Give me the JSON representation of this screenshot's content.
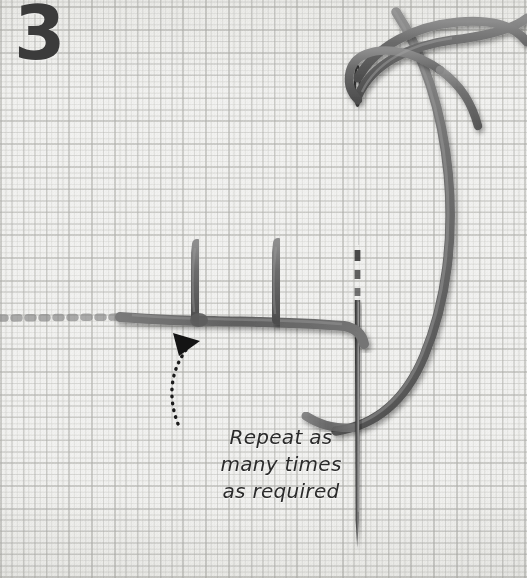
{
  "image": {
    "subject": "embroidery-blanket-stitch-step-photo",
    "width": 527,
    "height": 578,
    "background_color": "#f2f2f0"
  },
  "step": {
    "number": "3",
    "color": "#3b3b3b"
  },
  "annotation": {
    "lines": [
      "Repeat as",
      "many times",
      "as required"
    ],
    "full_text": "Repeat as many times as required",
    "color": "#2b2b2b",
    "arrow": {
      "style": "dotted-curved",
      "head": "solid-triangle",
      "points_to": "stitch-junction",
      "color": "#1b1b1b"
    }
  },
  "materials": {
    "fabric": {
      "name": "aida-cloth",
      "weave": "even-weave-grid",
      "color": "#f2f2f0"
    },
    "thread": {
      "color": "#6f6f6f",
      "shadow_color": "#4a4a4a",
      "highlight_color": "#9a9a9a"
    },
    "needle": {
      "color": "#4b4b4b",
      "highlight_color": "#8f8f8f",
      "orientation": "vertical",
      "eye_position": "top",
      "tip_position": "bottom"
    }
  },
  "stitch": {
    "type": "blanket-stitch",
    "legs": 2,
    "baseline": "horizontal-thread-row",
    "continues_left": true
  }
}
